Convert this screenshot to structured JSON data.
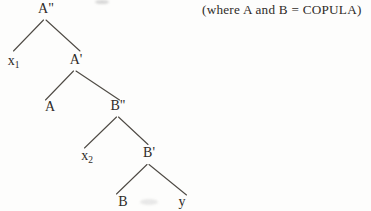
{
  "annotation": {
    "text": "(where A and B = COPULA)"
  },
  "tree": {
    "description": "binary branching syntax tree",
    "nodes": [
      {
        "id": "a-double-bar",
        "label": "A\"",
        "sub": ""
      },
      {
        "id": "x1",
        "label": "x",
        "sub": "1"
      },
      {
        "id": "a-bar",
        "label": "A'",
        "sub": ""
      },
      {
        "id": "a",
        "label": "A",
        "sub": ""
      },
      {
        "id": "b-double-bar",
        "label": "B\"",
        "sub": ""
      },
      {
        "id": "x2",
        "label": "x",
        "sub": "2"
      },
      {
        "id": "b-bar",
        "label": "B'",
        "sub": ""
      },
      {
        "id": "b",
        "label": "B",
        "sub": ""
      },
      {
        "id": "y",
        "label": "y",
        "sub": ""
      }
    ],
    "edges": [
      {
        "from": "a-double-bar",
        "to": "x1"
      },
      {
        "from": "a-double-bar",
        "to": "a-bar"
      },
      {
        "from": "a-bar",
        "to": "a"
      },
      {
        "from": "a-bar",
        "to": "b-double-bar"
      },
      {
        "from": "b-double-bar",
        "to": "x2"
      },
      {
        "from": "b-double-bar",
        "to": "b-bar"
      },
      {
        "from": "b-bar",
        "to": "b"
      },
      {
        "from": "b-bar",
        "to": "y"
      }
    ],
    "colors": {
      "ink": "#2f2b28",
      "line": "#4e4a44",
      "background": "#fdfdfc"
    }
  }
}
